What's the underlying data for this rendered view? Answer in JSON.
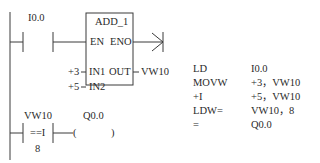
{
  "ladder": {
    "network1": {
      "contact_address": "I0.0",
      "block": {
        "name": "ADD_1",
        "pin_en": "EN",
        "pin_eno": "ENO",
        "pin_in1": "IN1",
        "pin_in2": "IN2",
        "pin_out": "OUT",
        "in1_value": "+3",
        "in2_value": "+5",
        "out_value": "VW10"
      }
    },
    "network2": {
      "compare_address": "VW10",
      "compare_operator": "==I",
      "compare_value": "8",
      "coil_address": "Q0.0",
      "coil_left": "(",
      "coil_right": ")"
    }
  },
  "statement_list": {
    "rows": [
      {
        "op": "LD",
        "operand": "I0.0"
      },
      {
        "op": "MOVW",
        "operand": "+3，VW10"
      },
      {
        "op": "+I",
        "operand": "+5，VW10"
      },
      {
        "op": "LDW=",
        "operand": "VW10，8"
      },
      {
        "op": "=",
        "operand": "Q0.0"
      }
    ]
  },
  "colors": {
    "line": "#3a3a3a",
    "text": "#2a2a2a",
    "background": "#ffffff"
  }
}
